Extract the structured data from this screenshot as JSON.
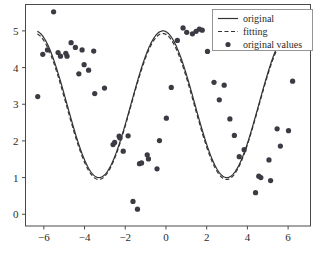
{
  "figure": {
    "width": 320,
    "height": 263,
    "background": "#ffffff",
    "foreground": "#2b2b2b"
  },
  "chart_data": {
    "type": "scatter",
    "title": "",
    "xlabel": "x",
    "ylabel": "y",
    "xlim": [
      -6.9,
      7.1
    ],
    "ylim": [
      -0.32,
      5.72
    ],
    "xticks": [
      -6,
      -4,
      -2,
      0,
      2,
      4,
      6
    ],
    "xticklabels": [
      "−6",
      "−4",
      "−2",
      "0",
      "2",
      "4",
      "6"
    ],
    "yticks": [
      0,
      1,
      2,
      3,
      4,
      5
    ],
    "yticklabels": [
      "0",
      "1",
      "2",
      "3",
      "4",
      "5"
    ],
    "grid": false,
    "legend_position": "upper right",
    "legend": [
      {
        "label": "original",
        "style": "solid-line",
        "color": "#333333"
      },
      {
        "label": "fitting",
        "style": "dashed-line",
        "color": "#333333"
      },
      {
        "label": "original values",
        "style": "marker-dot",
        "color": "#3b3b44"
      }
    ],
    "series": [
      {
        "name": "original",
        "type": "line",
        "style": "solid",
        "color": "#333333",
        "formula": "y = 3 + 2*sin(x + 1.72)",
        "amplitude": 2.0,
        "offset": 3.0,
        "phase": 1.72,
        "x_start": -6.32,
        "x_end": 6.32
      },
      {
        "name": "fitting",
        "type": "line",
        "style": "dashed",
        "color": "#333333",
        "formula": "y = 2.94 + 1.99*sin(x + 1.73)",
        "amplitude": 1.99,
        "offset": 2.94,
        "phase": 1.73,
        "x_start": -6.32,
        "x_end": 6.32
      },
      {
        "name": "original values",
        "type": "scatter",
        "color": "#3b3b44",
        "marker": "o",
        "marker_size": 4.2,
        "points": [
          [
            -6.3,
            3.21
          ],
          [
            -6.05,
            4.36
          ],
          [
            -5.82,
            4.48
          ],
          [
            -5.52,
            5.52
          ],
          [
            -5.3,
            4.41
          ],
          [
            -5.18,
            4.31
          ],
          [
            -4.92,
            4.39
          ],
          [
            -4.86,
            4.31
          ],
          [
            -4.66,
            4.68
          ],
          [
            -4.45,
            4.55
          ],
          [
            -4.28,
            3.83
          ],
          [
            -4.12,
            4.48
          ],
          [
            -4.02,
            4.08
          ],
          [
            -3.8,
            3.93
          ],
          [
            -3.55,
            4.45
          ],
          [
            -3.5,
            3.29
          ],
          [
            -3.02,
            3.44
          ],
          [
            -2.6,
            1.9
          ],
          [
            -2.52,
            1.96
          ],
          [
            -2.3,
            2.13
          ],
          [
            -2.26,
            2.08
          ],
          [
            -2.1,
            1.72
          ],
          [
            -1.86,
            2.14
          ],
          [
            -1.62,
            0.35
          ],
          [
            -1.4,
            0.14
          ],
          [
            -1.3,
            1.38
          ],
          [
            -1.2,
            1.4
          ],
          [
            -0.92,
            1.62
          ],
          [
            -0.86,
            1.51
          ],
          [
            -0.44,
            1.24
          ],
          [
            -0.32,
            2.01
          ],
          [
            0.02,
            2.62
          ],
          [
            0.26,
            3.46
          ],
          [
            0.56,
            4.74
          ],
          [
            0.84,
            5.08
          ],
          [
            1.02,
            4.96
          ],
          [
            1.3,
            4.92
          ],
          [
            1.48,
            4.99
          ],
          [
            1.64,
            5.05
          ],
          [
            1.78,
            5.02
          ],
          [
            2.04,
            4.44
          ],
          [
            2.36,
            3.6
          ],
          [
            2.62,
            3.12
          ],
          [
            2.86,
            3.52
          ],
          [
            3.14,
            2.6
          ],
          [
            3.36,
            2.15
          ],
          [
            3.6,
            1.57
          ],
          [
            3.84,
            1.76
          ],
          [
            4.4,
            0.59
          ],
          [
            4.56,
            1.04
          ],
          [
            4.66,
            1.0
          ],
          [
            5.06,
            1.48
          ],
          [
            5.14,
            0.92
          ],
          [
            5.46,
            2.33
          ],
          [
            5.62,
            1.86
          ],
          [
            6.02,
            2.28
          ],
          [
            6.22,
            3.63
          ]
        ]
      }
    ]
  }
}
